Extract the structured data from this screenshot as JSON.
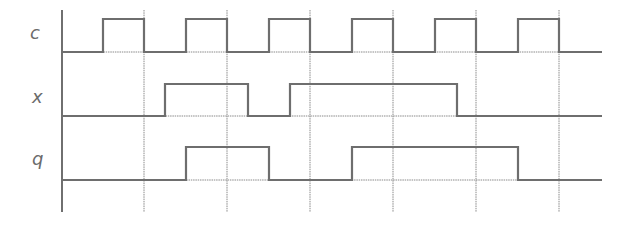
{
  "diagram": {
    "type": "timing-diagram",
    "colors": {
      "signal": "#6e6e6e",
      "grid": "#8a8a8a",
      "axis": "#333333",
      "label": "#6b6b6b"
    },
    "axis": {
      "x": 62,
      "y_top": 10,
      "y_bottom": 212
    },
    "grid_lines_x": [
      144,
      227,
      310,
      393,
      476,
      559
    ],
    "x_end": 602,
    "signals": [
      {
        "name": "c",
        "label_x": 30,
        "label_y": 26,
        "low_y": 52,
        "high_y": 19,
        "initial": 0,
        "transitions": [
          {
            "x": 103,
            "to": 1
          },
          {
            "x": 144,
            "to": 0
          },
          {
            "x": 186,
            "to": 1
          },
          {
            "x": 227,
            "to": 0
          },
          {
            "x": 269,
            "to": 1
          },
          {
            "x": 310,
            "to": 0
          },
          {
            "x": 352,
            "to": 1
          },
          {
            "x": 393,
            "to": 0
          },
          {
            "x": 435,
            "to": 1
          },
          {
            "x": 476,
            "to": 0
          },
          {
            "x": 518,
            "to": 1
          },
          {
            "x": 559,
            "to": 0
          }
        ]
      },
      {
        "name": "x",
        "label_x": 32,
        "label_y": 90,
        "low_y": 116,
        "high_y": 84,
        "initial": 0,
        "transitions": [
          {
            "x": 165,
            "to": 1
          },
          {
            "x": 248,
            "to": 0
          },
          {
            "x": 290,
            "to": 1
          },
          {
            "x": 457,
            "to": 0
          }
        ]
      },
      {
        "name": "q",
        "label_x": 32,
        "label_y": 152,
        "low_y": 180,
        "high_y": 147,
        "initial": 0,
        "transitions": [
          {
            "x": 186,
            "to": 1
          },
          {
            "x": 269,
            "to": 0
          },
          {
            "x": 352,
            "to": 1
          },
          {
            "x": 518,
            "to": 0
          }
        ]
      }
    ]
  }
}
